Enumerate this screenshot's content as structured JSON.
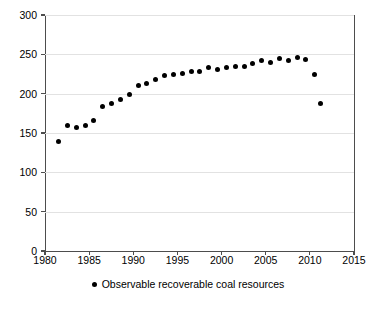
{
  "chart_data": {
    "type": "scatter",
    "title": "",
    "xlabel": "",
    "ylabel": "",
    "xlim": [
      1980,
      2015
    ],
    "ylim": [
      0,
      300
    ],
    "grid": true,
    "legend_position": "bottom-center",
    "xticks": [
      1980,
      1985,
      1990,
      1995,
      2000,
      2005,
      2010,
      2015
    ],
    "yticks": [
      0,
      50,
      100,
      150,
      200,
      250,
      300
    ],
    "marker_color": "#000000",
    "gridline_color": "#e2e2e2",
    "axis_color": "#4d4d4d",
    "series": [
      {
        "name": "Observable recoverable coal resources",
        "x": [
          1981,
          1982,
          1983,
          1984,
          1985,
          1986,
          1987,
          1988,
          1989,
          1990,
          1991,
          1992,
          1993,
          1994,
          1995,
          1996,
          1997,
          1998,
          1999,
          2000,
          2001,
          2002,
          2003,
          2004,
          2005,
          2006,
          2007,
          2008,
          2009,
          2010
        ],
        "values": [
          139,
          160,
          157,
          160,
          166,
          184,
          188,
          192,
          199,
          211,
          213,
          218,
          223,
          224,
          226,
          228,
          228,
          233,
          231,
          233,
          234,
          235,
          238,
          242,
          240,
          245,
          242,
          246,
          244,
          224
        ],
        "extra_points": [
          {
            "x": 2010.7,
            "y": 188
          }
        ]
      }
    ]
  },
  "legend": {
    "label": "Observable recoverable coal resources",
    "marker": "dot-marker"
  }
}
